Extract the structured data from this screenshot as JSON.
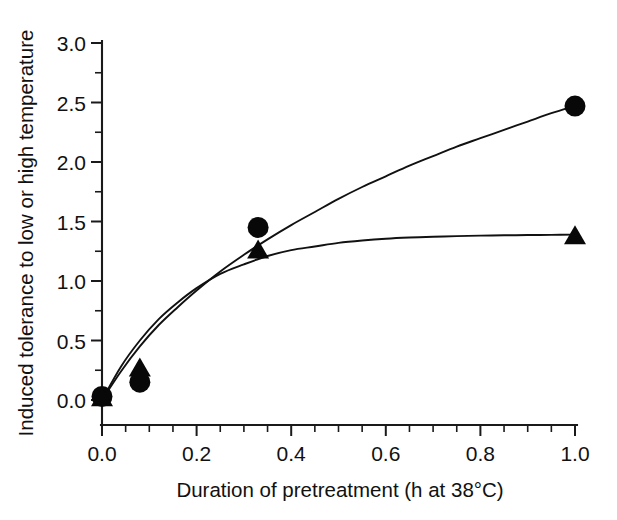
{
  "chart_data": {
    "type": "scatter",
    "title": "",
    "xlabel": "Duration of pretreatment (h at 38°C)",
    "ylabel": "Induced tolerance to low or high temperature",
    "xlim": [
      0.0,
      1.0
    ],
    "ylim": [
      0.0,
      3.0
    ],
    "xticks": [
      0.0,
      0.2,
      0.4,
      0.6,
      0.8,
      1.0
    ],
    "xtick_labels": [
      "0.0",
      "0.2",
      "0.4",
      "0.6",
      "0.8",
      "1.0"
    ],
    "xminor_step": 0.05,
    "yticks": [
      0.0,
      0.5,
      1.0,
      1.5,
      2.0,
      2.5,
      3.0
    ],
    "ytick_labels": [
      "0.0",
      "0.5",
      "1.0",
      "1.5",
      "2.0",
      "2.5",
      "3.0"
    ],
    "yminor_step": 0.25,
    "grid": false,
    "legend": "none",
    "marker_color": "#080808",
    "curve_color": "#111111",
    "axis_color": "#1a1a1a",
    "series": [
      {
        "name": "circles",
        "marker": "filled-circle",
        "x": [
          0.0,
          0.08,
          0.33,
          1.0
        ],
        "values": [
          0.03,
          0.15,
          1.45,
          2.47
        ],
        "fit_curve": {
          "model": "saturating",
          "points_x": [
            0.0,
            0.04,
            0.08,
            0.12,
            0.16,
            0.2,
            0.25,
            0.3,
            0.35,
            0.4,
            0.45,
            0.5,
            0.55,
            0.6,
            0.65,
            0.7,
            0.75,
            0.8,
            0.85,
            0.9,
            0.95,
            1.0
          ],
          "points_y": [
            0.0,
            0.24,
            0.45,
            0.63,
            0.78,
            0.92,
            1.08,
            1.22,
            1.35,
            1.47,
            1.58,
            1.69,
            1.79,
            1.88,
            1.97,
            2.05,
            2.13,
            2.2,
            2.27,
            2.34,
            2.41,
            2.47
          ]
        }
      },
      {
        "name": "triangles",
        "marker": "filled-triangle",
        "x": [
          0.0,
          0.08,
          0.33,
          1.0
        ],
        "values": [
          0.02,
          0.27,
          1.26,
          1.38
        ],
        "fit_curve": {
          "model": "saturating",
          "points_x": [
            0.0,
            0.04,
            0.08,
            0.12,
            0.16,
            0.2,
            0.25,
            0.3,
            0.35,
            0.4,
            0.45,
            0.5,
            0.55,
            0.6,
            0.65,
            0.7,
            0.75,
            0.8,
            0.85,
            0.9,
            0.95,
            1.0
          ],
          "points_y": [
            0.0,
            0.28,
            0.5,
            0.68,
            0.82,
            0.94,
            1.06,
            1.14,
            1.21,
            1.26,
            1.29,
            1.32,
            1.34,
            1.355,
            1.365,
            1.372,
            1.377,
            1.381,
            1.384,
            1.386,
            1.388,
            1.39
          ]
        }
      }
    ]
  },
  "axes": {
    "x_title": "Duration of pretreatment (h at 38°C)",
    "y_title": "Induced tolerance to low or high temperature"
  }
}
